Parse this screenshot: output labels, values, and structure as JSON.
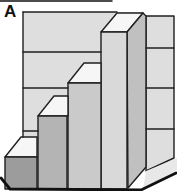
{
  "figure": {
    "panel_label": "A",
    "canvas": {
      "width": 177,
      "height": 191,
      "background": "#ffffff"
    },
    "colors": {
      "wall": "#dedede",
      "step_top": "#f6f6f6",
      "floor": "#e8e8e8",
      "step1_front": "#9c9c9c",
      "step2_front": "#b4b4b4",
      "step3_front": "#cacaca",
      "step4_front": "#d9d9d9",
      "step4_side": "#c0c0c0",
      "stroke": "#1f1f1f",
      "frame": "#111111"
    },
    "stroke_width": 1.4,
    "shapes": [
      {
        "name": "back-wall-face",
        "fill": "wall",
        "outlined": false,
        "points": [
          [
            23,
            12
          ],
          [
            144,
            12
          ],
          [
            144,
            160
          ],
          [
            23,
            160
          ]
        ]
      },
      {
        "name": "right-wall-face",
        "fill": "wall",
        "outlined": true,
        "points": [
          [
            146,
            16
          ],
          [
            174,
            16
          ],
          [
            174,
            158
          ],
          [
            146,
            171
          ]
        ]
      },
      {
        "name": "floor-strip",
        "fill": "floor",
        "outlined": false,
        "points": [
          [
            146,
            171
          ],
          [
            177,
            158
          ],
          [
            177,
            170
          ],
          [
            143,
            189
          ]
        ]
      },
      {
        "name": "step4-top-face",
        "fill": "step_top",
        "outlined": true,
        "points": [
          [
            101,
            32
          ],
          [
            117,
            13
          ],
          [
            143,
            13
          ],
          [
            127,
            32
          ]
        ]
      },
      {
        "name": "step4-side-face",
        "fill": "step4_side",
        "outlined": true,
        "points": [
          [
            127,
            32
          ],
          [
            143,
            13
          ],
          [
            146,
            16
          ],
          [
            146,
            167
          ],
          [
            128,
            188
          ]
        ]
      },
      {
        "name": "step4-front-face",
        "fill": "step4_front",
        "outlined": true,
        "points": [
          [
            101,
            32
          ],
          [
            127,
            32
          ],
          [
            127,
            189
          ],
          [
            101,
            189
          ]
        ]
      },
      {
        "name": "step3-top-face",
        "fill": "step_top",
        "outlined": true,
        "points": [
          [
            68,
            83
          ],
          [
            84,
            63
          ],
          [
            101,
            63
          ],
          [
            101,
            83
          ]
        ]
      },
      {
        "name": "step3-front-face",
        "fill": "step3_front",
        "outlined": true,
        "points": [
          [
            68,
            83
          ],
          [
            101,
            83
          ],
          [
            101,
            189
          ],
          [
            68,
            189
          ]
        ]
      },
      {
        "name": "step2-top-face",
        "fill": "step_top",
        "outlined": true,
        "points": [
          [
            38,
            116
          ],
          [
            54,
            96
          ],
          [
            68,
            96
          ],
          [
            68,
            116
          ]
        ]
      },
      {
        "name": "step2-front-face",
        "fill": "step2_front",
        "outlined": true,
        "points": [
          [
            38,
            116
          ],
          [
            67,
            116
          ],
          [
            67,
            189
          ],
          [
            38,
            189
          ]
        ]
      },
      {
        "name": "step1-top-face",
        "fill": "step_top",
        "outlined": true,
        "points": [
          [
            5,
            157
          ],
          [
            21,
            137
          ],
          [
            37,
            137
          ],
          [
            37,
            157
          ]
        ]
      },
      {
        "name": "step1-front-face",
        "fill": "step1_front",
        "outlined": true,
        "points": [
          [
            5,
            157
          ],
          [
            37,
            157
          ],
          [
            37,
            189
          ],
          [
            5,
            189
          ]
        ]
      }
    ],
    "lines": [
      {
        "name": "back-wall-top-edge",
        "x1": 23,
        "y1": 12,
        "x2": 117,
        "y2": 12,
        "width": 1.4,
        "color": "stroke"
      },
      {
        "name": "back-wall-left-edge",
        "x1": 23,
        "y1": 12,
        "x2": 23,
        "y2": 137,
        "width": 1.4,
        "color": "stroke"
      },
      {
        "name": "back-wall-stratum-line-1",
        "x1": 23,
        "y1": 52,
        "x2": 101,
        "y2": 52,
        "width": 1.4,
        "color": "stroke"
      },
      {
        "name": "back-wall-stratum-line-2",
        "x1": 23,
        "y1": 88,
        "x2": 68,
        "y2": 88,
        "width": 1.4,
        "color": "stroke"
      },
      {
        "name": "back-wall-stratum-line-3",
        "x1": 23,
        "y1": 131,
        "x2": 38,
        "y2": 131,
        "width": 1.4,
        "color": "stroke"
      },
      {
        "name": "right-wall-stratum-line-1",
        "x1": 146,
        "y1": 48,
        "x2": 174,
        "y2": 48,
        "width": 1.4,
        "color": "stroke"
      },
      {
        "name": "right-wall-stratum-line-2",
        "x1": 146,
        "y1": 88,
        "x2": 174,
        "y2": 88,
        "width": 1.4,
        "color": "stroke"
      },
      {
        "name": "right-wall-stratum-line-3",
        "x1": 146,
        "y1": 129,
        "x2": 174,
        "y2": 129,
        "width": 1.4,
        "color": "stroke"
      },
      {
        "name": "frame-top-edge",
        "x1": 0,
        "y1": 1,
        "x2": 112,
        "y2": 1,
        "width": 1.5,
        "color": "frame"
      }
    ],
    "polylines": [
      {
        "name": "frame-bottom-edge",
        "width": 2.8,
        "color": "frame",
        "points": [
          [
            1,
            178
          ],
          [
            10,
            189
          ],
          [
            141,
            190
          ],
          [
            176,
            173
          ]
        ]
      }
    ]
  }
}
